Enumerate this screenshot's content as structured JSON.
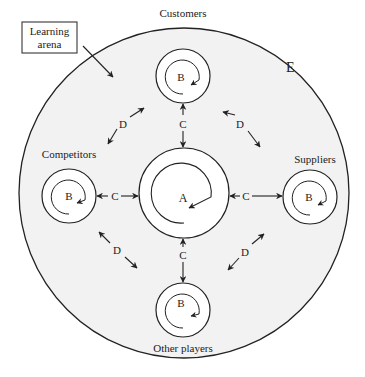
{
  "diagram": {
    "arena_label_line1": "Learning",
    "arena_label_line2": "arena",
    "outer_circle_label": "E",
    "center_node": {
      "letter": "A"
    },
    "nodes": [
      {
        "name": "Customers",
        "letter": "B"
      },
      {
        "name": "Competitors",
        "letter": "B"
      },
      {
        "name": "Suppliers",
        "letter": "B"
      },
      {
        "name": "Other players",
        "letter": "B"
      }
    ],
    "links_c": [
      "C",
      "C",
      "C",
      "C"
    ],
    "links_d": [
      "D",
      "D",
      "D",
      "D"
    ],
    "colors": {
      "arena_fill": "#f2f2f2",
      "stroke": "#222222",
      "background": "#ffffff"
    }
  }
}
